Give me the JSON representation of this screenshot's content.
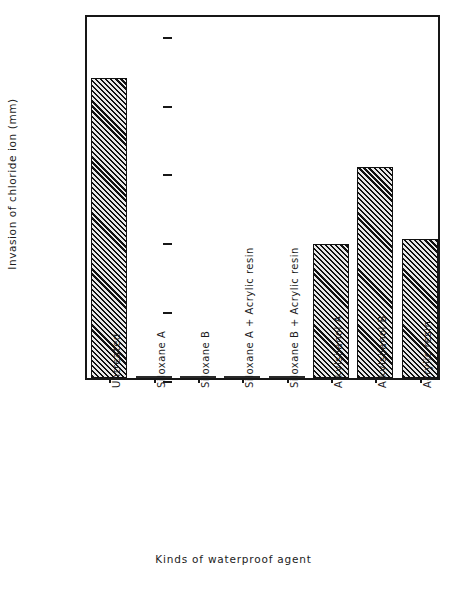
{
  "chart_data": {
    "type": "bar",
    "title": "",
    "xlabel": "Kinds of waterproof agent",
    "ylabel": "Invasion of chloride ion (mm)",
    "categories": [
      "Untreated",
      "Siloxane A",
      "Siloxane B",
      "Siloxane A + Acrylic resin",
      "Siloxane B + Acrylic resin",
      "Alkylsilanol A",
      "Alkylsilanol B",
      "Acrylic resin"
    ],
    "values": [
      21.8,
      0,
      0,
      0,
      0,
      9.7,
      15.3,
      10.1
    ],
    "ylim": [
      0,
      26.5
    ],
    "yticks": [
      0,
      5,
      10,
      15,
      20,
      25
    ],
    "ytick_labels": [
      "0",
      "5",
      "10",
      "15",
      "20",
      "25"
    ],
    "grid": false,
    "legend": "none",
    "bar_fill": "diagonal-hatch",
    "bar_edge_color": "#111111"
  },
  "axis": {
    "y_title": "Invasion of chloride ion (mm)",
    "x_title": "Kinds of waterproof agent"
  }
}
